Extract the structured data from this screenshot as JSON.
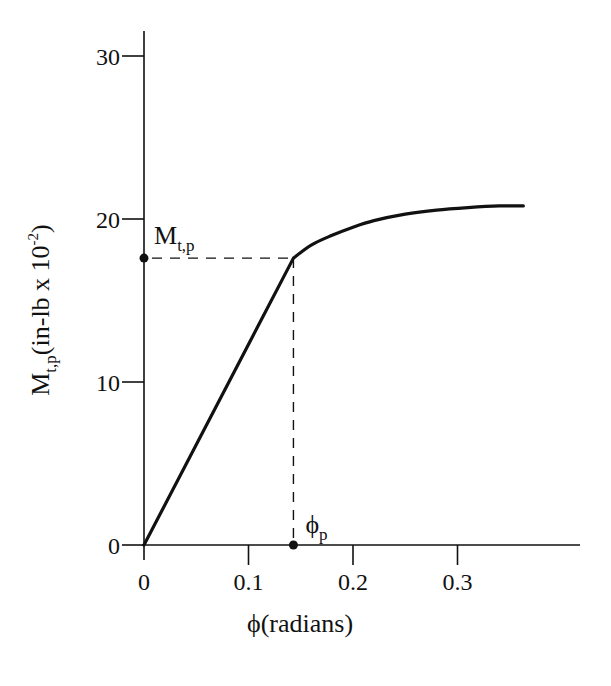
{
  "chart_data": {
    "type": "line",
    "title": "",
    "xlabel": "ϕ (radians)",
    "ylabel": "M_t,p (in-lb x 10^-2)",
    "xlabel_parts": {
      "symbol": "ϕ",
      "text": "(radians)"
    },
    "ylabel_parts": {
      "main": "M",
      "sub": "t,p",
      "text": "(in-lb x 10",
      "sup": "-2",
      "close": ")"
    },
    "xlim": [
      0,
      0.41
    ],
    "ylim": [
      0,
      31.5
    ],
    "x_ticks": [
      0,
      0.1,
      0.2,
      0.3
    ],
    "x_tick_labels": [
      "0",
      "0.1",
      "0.2",
      "0.3"
    ],
    "y_ticks": [
      0,
      10,
      20,
      30
    ],
    "y_tick_labels": [
      "0",
      "10",
      "20",
      "30"
    ],
    "grid": false,
    "legend": null,
    "series": [
      {
        "name": "Torque-twist curve",
        "x": [
          0,
          0.143,
          0.16,
          0.18,
          0.2,
          0.22,
          0.25,
          0.28,
          0.31,
          0.34,
          0.363
        ],
        "y": [
          0,
          17.6,
          18.4,
          19.0,
          19.5,
          19.9,
          20.3,
          20.55,
          20.7,
          20.8,
          20.8
        ]
      }
    ],
    "annotations": [
      {
        "type": "point",
        "x": 0,
        "y": 17.6,
        "label": "M_t,p",
        "label_main": "M",
        "label_sub": "t,p"
      },
      {
        "type": "point",
        "x": 0.143,
        "y": 0,
        "label": "ϕ_p",
        "label_main": "ϕ",
        "label_sub": "p"
      },
      {
        "type": "dashed-hline",
        "from_x": 0,
        "to_x": 0.143,
        "y": 17.6
      },
      {
        "type": "dashed-vline",
        "x": 0.143,
        "from_y": 0,
        "to_y": 17.6
      }
    ]
  }
}
